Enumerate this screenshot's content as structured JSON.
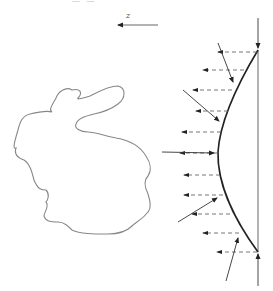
{
  "axis": {
    "label": "z",
    "direction": "left",
    "from": [
      158,
      25
    ],
    "to": [
      118,
      25
    ]
  },
  "colors": {
    "outline": "#888888",
    "curve": "#222222",
    "arrow": "#333333",
    "dashed": "#666666",
    "background": "#ffffff"
  },
  "screen_line": {
    "x": 258,
    "y1": 50,
    "y2": 252
  },
  "boundary_arrows": [
    {
      "name": "top-down-arrow",
      "from": [
        258,
        18
      ],
      "to": [
        258,
        48
      ]
    },
    {
      "name": "bottom-up-arrow",
      "from": [
        258,
        286
      ],
      "to": [
        258,
        254
      ]
    }
  ],
  "curve_path": "M258,50 C240,80 220,120 218,152 C217,185 236,222 258,252",
  "dashed_rays": [
    {
      "y": 52,
      "x_start": 257,
      "x_end": 218
    },
    {
      "y": 70,
      "x_start": 244,
      "x_end": 203
    },
    {
      "y": 90,
      "x_start": 232,
      "x_end": 193
    },
    {
      "y": 111,
      "x_start": 228,
      "x_end": 196
    },
    {
      "y": 132,
      "x_start": 221,
      "x_end": 182
    },
    {
      "y": 153,
      "x_start": 218,
      "x_end": 180
    },
    {
      "y": 175,
      "x_start": 220,
      "x_end": 184
    },
    {
      "y": 195,
      "x_start": 223,
      "x_end": 184
    },
    {
      "y": 214,
      "x_start": 230,
      "x_end": 192
    },
    {
      "y": 233,
      "x_start": 239,
      "x_end": 203
    },
    {
      "y": 252,
      "x_start": 257,
      "x_end": 217
    }
  ],
  "incident_rays": [
    {
      "from": [
        218,
        43
      ],
      "to": [
        233,
        82
      ]
    },
    {
      "from": [
        183,
        90
      ],
      "to": [
        219,
        121
      ]
    },
    {
      "from": [
        162,
        152
      ],
      "to": [
        214,
        153
      ]
    },
    {
      "from": [
        178,
        222
      ],
      "to": [
        217,
        198
      ]
    },
    {
      "from": [
        226,
        281
      ],
      "to": [
        238,
        238
      ]
    }
  ],
  "bunny_path": "M72,90 C66,86 58,92 56,98 C53,104 48,110 52,112 C46,110 38,112 30,114 C22,116 20,122 18,130 C15,140 12,150 16,148 C14,154 18,158 24,160 C30,164 32,172 34,180 C38,190 42,190 46,190 C50,194 48,200 46,202 C50,206 44,212 44,216 C46,222 52,222 58,222 C64,222 68,226 72,230 C80,234 94,234 108,234 C120,234 128,230 132,226 C136,222 142,220 148,212 C152,208 150,200 148,194 C144,186 144,180 148,176 C152,170 150,162 146,156 C140,146 128,140 116,138 C106,136 94,132 88,132 C80,132 74,128 76,124 C78,118 86,116 94,114 C104,112 110,110 118,104 C126,98 126,88 118,86 C108,86 98,92 90,96 C84,98 76,100 78,98 C82,94 82,88 72,90 Z"
}
